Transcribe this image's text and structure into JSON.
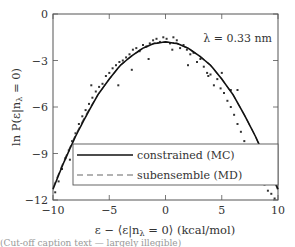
{
  "chart_data": {
    "type": "scatter",
    "title": "",
    "annotation": "λ = 0.33 nm",
    "xlabel": "ε − ⟨ε|nλ = 0⟩ (kcal/mol)",
    "ylabel": "ln P(ε|nλ = 0)",
    "xlim": [
      -10,
      10
    ],
    "ylim": [
      -12,
      0
    ],
    "xticks": [
      -10,
      -5,
      0,
      5,
      10
    ],
    "xtick_labels": [
      "−10",
      "−5",
      "0",
      "5",
      "10"
    ],
    "yticks": [
      0,
      -3,
      -6,
      -9,
      -12
    ],
    "ytick_labels": [
      "0",
      "−3",
      "−6",
      "−9",
      "−12"
    ],
    "grid": false,
    "legend_position": "lower-left",
    "series": [
      {
        "name": "constrained (MC)",
        "style": "solid line",
        "color": "#111111",
        "x": [
          -10,
          -9,
          -8,
          -7,
          -6,
          -5,
          -4,
          -3,
          -2,
          -1,
          0,
          1,
          2,
          3,
          4,
          5,
          6,
          7,
          8,
          9,
          10
        ],
        "y": [
          -11.3,
          -9.5,
          -7.9,
          -6.5,
          -5.2,
          -4.2,
          -3.3,
          -2.7,
          -2.2,
          -1.9,
          -1.8,
          -1.9,
          -2.2,
          -2.7,
          -3.3,
          -4.2,
          -5.2,
          -6.5,
          -7.9,
          -9.5,
          -11.3
        ]
      },
      {
        "name": "subensemble (MD)",
        "style": "dashed line",
        "color": "#555555",
        "x": [
          -10,
          -9,
          -8,
          -7,
          -6,
          -5,
          -4,
          -3,
          -2,
          -1,
          0,
          1,
          2,
          3,
          4,
          5,
          6,
          7,
          8,
          9,
          10
        ],
        "y": [
          -11.2,
          -9.4,
          -7.8,
          -6.4,
          -5.2,
          -4.2,
          -3.3,
          -2.7,
          -2.2,
          -1.9,
          -1.8,
          -1.9,
          -2.2,
          -2.7,
          -3.3,
          -4.2,
          -5.2,
          -6.5,
          -7.9,
          -9.6,
          -11.4
        ]
      },
      {
        "name": "sampled points",
        "style": "markers",
        "color": "#333333",
        "x": [
          -9.8,
          -9.5,
          -9.2,
          -8.9,
          -8.6,
          -8.3,
          -8.0,
          -7.7,
          -7.4,
          -7.1,
          -6.8,
          -6.5,
          -6.2,
          -5.9,
          -5.6,
          -5.3,
          -5.0,
          -4.7,
          -4.4,
          -4.1,
          -3.8,
          -3.5,
          -3.2,
          -2.9,
          -2.6,
          -2.3,
          -2.0,
          -1.7,
          -1.4,
          -1.1,
          -0.8,
          -0.5,
          -0.2,
          0.1,
          0.4,
          0.7,
          1.0,
          1.3,
          1.6,
          1.9,
          2.2,
          2.5,
          2.8,
          3.1,
          3.4,
          3.7,
          4.0,
          4.3,
          4.6,
          4.9,
          5.2,
          5.5,
          5.8,
          6.1,
          6.4,
          6.7,
          7.0,
          7.3,
          7.6,
          7.9,
          8.2,
          8.5,
          8.8,
          9.1,
          9.4,
          9.7,
          -8.5,
          -4.2,
          -6.6,
          -3.0,
          -1.5,
          0.6,
          2.0,
          3.8,
          5.0,
          5.8,
          6.4,
          9.3
        ],
        "y": [
          -11.5,
          -10.8,
          -10.0,
          -9.3,
          -8.8,
          -8.2,
          -7.7,
          -7.1,
          -6.6,
          -6.2,
          -5.8,
          -5.4,
          -5.0,
          -4.7,
          -4.5,
          -4.0,
          -3.8,
          -3.5,
          -3.3,
          -3.1,
          -3.0,
          -2.8,
          -2.6,
          -2.3,
          -2.2,
          -2.4,
          -2.0,
          -2.1,
          -1.9,
          -1.7,
          -1.6,
          -1.8,
          -1.5,
          -1.6,
          -1.9,
          -1.5,
          -1.7,
          -2.2,
          -2.0,
          -2.3,
          -2.6,
          -2.5,
          -3.1,
          -2.9,
          -3.4,
          -3.8,
          -3.9,
          -4.6,
          -4.2,
          -4.8,
          -5.1,
          -5.6,
          -6.0,
          -6.5,
          -7.1,
          -7.6,
          -8.2,
          -8.7,
          -9.2,
          -9.8,
          -10.2,
          -10.7,
          -11.0,
          -11.4,
          -11.6,
          -11.9,
          -9.4,
          -4.6,
          -4.6,
          -3.6,
          -2.9,
          -2.3,
          -3.3,
          -4.0,
          -3.8,
          -4.9,
          -4.9,
          -10.4
        ]
      }
    ]
  },
  "legend": {
    "items": [
      {
        "label": "constrained (MC)",
        "style": "solid"
      },
      {
        "label": "subensemble (MD)",
        "style": "dashed"
      }
    ]
  },
  "labels": {
    "annotation": "λ = 0.33 nm",
    "xlabel_main": "ε − ⟨ε|n",
    "xlabel_sub": "λ",
    "xlabel_rest": " = 0⟩ (kcal/mol)",
    "ylabel_main": "ln P(ε|n",
    "ylabel_sub": "λ",
    "ylabel_rest": " = 0)",
    "caption": "(Cut-off caption text — largely illegible)"
  },
  "colors": {
    "axis": "#555555",
    "line": "#111111",
    "dashed": "#666666",
    "points": "#333333"
  }
}
